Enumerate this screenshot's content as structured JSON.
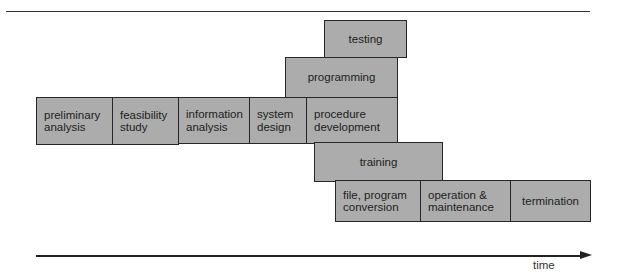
{
  "diagram": {
    "type": "system-development-life-cycle-timeline",
    "axis_label": "time",
    "phases": [
      {
        "id": "testing",
        "label": "testing",
        "x": 324,
        "y": 20,
        "w": 83,
        "h": 38,
        "align": "center"
      },
      {
        "id": "programming",
        "label": "programming",
        "x": 285,
        "y": 57,
        "w": 113,
        "h": 41,
        "align": "center"
      },
      {
        "id": "preliminary-analysis",
        "label": "preliminary\nanalysis",
        "x": 36,
        "y": 97,
        "w": 77,
        "h": 48,
        "align": "left"
      },
      {
        "id": "feasibility-study",
        "label": "feasibility\nstudy",
        "x": 112,
        "y": 97,
        "w": 67,
        "h": 48,
        "align": "left"
      },
      {
        "id": "information-analysis",
        "label": "information\nanalysis",
        "x": 178,
        "y": 97,
        "w": 72,
        "h": 47,
        "align": "left"
      },
      {
        "id": "system-design",
        "label": "system\ndesign",
        "x": 249,
        "y": 97,
        "w": 58,
        "h": 47,
        "align": "left"
      },
      {
        "id": "procedure-development",
        "label": "procedure\ndevelopment",
        "x": 306,
        "y": 97,
        "w": 92,
        "h": 47,
        "align": "left"
      },
      {
        "id": "training",
        "label": "training",
        "x": 314,
        "y": 142,
        "w": 129,
        "h": 40,
        "align": "center"
      },
      {
        "id": "file-program-conversion",
        "label": "file, program\nconversion",
        "x": 335,
        "y": 180,
        "w": 86,
        "h": 42,
        "align": "left"
      },
      {
        "id": "operation-maintenance",
        "label": "operation &\nmaintenance",
        "x": 420,
        "y": 180,
        "w": 91,
        "h": 42,
        "align": "left"
      },
      {
        "id": "termination",
        "label": "termination",
        "x": 510,
        "y": 180,
        "w": 81,
        "h": 42,
        "align": "center"
      }
    ],
    "colors": {
      "box_fill": "#acacac",
      "border": "#262626",
      "text": "#222222"
    }
  }
}
